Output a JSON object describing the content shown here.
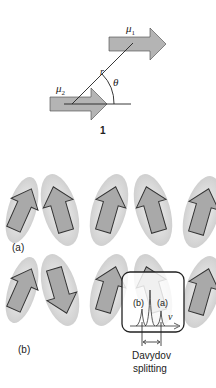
{
  "figure1": {
    "mu1_label": "μ",
    "mu1_sub": "1",
    "mu2_label": "μ",
    "mu2_sub": "2",
    "r_label": "r",
    "theta_label": "θ",
    "number_label": "1"
  },
  "panel_a": {
    "label": "(a)"
  },
  "panel_b": {
    "label": "(b)"
  },
  "inset": {
    "peak_b_label": "(b)",
    "peak_a_label": "(a)",
    "axis_label": "ν",
    "caption_line1": "Davydov",
    "caption_line2": "splitting"
  },
  "colors": {
    "arrow_fill": "#a9a9a9",
    "ellipse_fill": "#d8d8d8",
    "stroke": "#333333",
    "background": "#ffffff"
  }
}
